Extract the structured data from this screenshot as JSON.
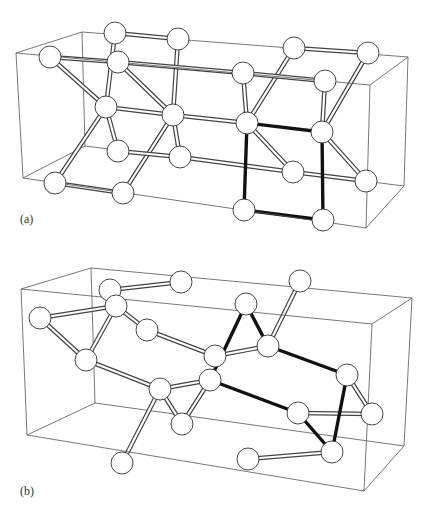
{
  "figure": {
    "width": 433,
    "height": 514,
    "atom_radius": 11,
    "colors": {
      "background": "#ffffff",
      "box_edge": "#555555",
      "bond_outline": "#444444",
      "bond_fill": "#ffffff",
      "highlighted_bond": "#111111",
      "atom_outline": "#333333",
      "atom_shade": "#888888"
    },
    "panels": [
      {
        "id": "a",
        "label": "(a)",
        "label_pos": [
          20,
          212
        ],
        "box": {
          "back": [
            [
              82,
              32
            ],
            [
              408,
              57
            ],
            [
              404,
              186
            ],
            [
              85,
              146
            ]
          ],
          "front": [
            [
              16,
              53
            ],
            [
              370,
              85
            ],
            [
              366,
              228
            ],
            [
              23,
              178
            ]
          ]
        },
        "atoms": [
          {
            "id": "A1",
            "x": 115,
            "y": 33,
            "shaded": true
          },
          {
            "id": "A2",
            "x": 178,
            "y": 39,
            "shaded": false
          },
          {
            "id": "A3",
            "x": 50,
            "y": 57,
            "shaded": true
          },
          {
            "id": "A4",
            "x": 118,
            "y": 62,
            "shaded": false
          },
          {
            "id": "A5",
            "x": 106,
            "y": 107,
            "shaded": false
          },
          {
            "id": "A6",
            "x": 173,
            "y": 115,
            "shaded": true
          },
          {
            "id": "A7",
            "x": 118,
            "y": 151,
            "shaded": true
          },
          {
            "id": "A8",
            "x": 180,
            "y": 157,
            "shaded": false
          },
          {
            "id": "A9",
            "x": 55,
            "y": 183,
            "shaded": true
          },
          {
            "id": "A10",
            "x": 123,
            "y": 193,
            "shaded": false
          },
          {
            "id": "B1",
            "x": 294,
            "y": 48,
            "shaded": false
          },
          {
            "id": "B2",
            "x": 368,
            "y": 53,
            "shaded": true
          },
          {
            "id": "B3",
            "x": 243,
            "y": 73,
            "shaded": false
          },
          {
            "id": "B4",
            "x": 325,
            "y": 81,
            "shaded": true
          },
          {
            "id": "B5",
            "x": 247,
            "y": 123,
            "shaded": true
          },
          {
            "id": "B6",
            "x": 322,
            "y": 132,
            "shaded": false
          },
          {
            "id": "B7",
            "x": 293,
            "y": 172,
            "shaded": false
          },
          {
            "id": "B8",
            "x": 366,
            "y": 181,
            "shaded": true
          },
          {
            "id": "B9",
            "x": 244,
            "y": 210,
            "shaded": false
          },
          {
            "id": "B10",
            "x": 323,
            "y": 220,
            "shaded": true
          }
        ],
        "bonds": [
          [
            "A1",
            "A2",
            false
          ],
          [
            "A1",
            "A5",
            false
          ],
          [
            "A3",
            "A4",
            false
          ],
          [
            "A3",
            "A5",
            false
          ],
          [
            "A4",
            "A6",
            false
          ],
          [
            "A2",
            "A6",
            false
          ],
          [
            "A5",
            "A6",
            false
          ],
          [
            "A5",
            "A7",
            false
          ],
          [
            "A5",
            "A9",
            false
          ],
          [
            "A6",
            "A10",
            false
          ],
          [
            "A6",
            "A8",
            false
          ],
          [
            "A7",
            "A8",
            false
          ],
          [
            "A9",
            "A10",
            false
          ],
          [
            "A6",
            "B5",
            false
          ],
          [
            "A8",
            "B7",
            false
          ],
          [
            "A4",
            "B3",
            false
          ],
          [
            "B1",
            "B2",
            false
          ],
          [
            "B1",
            "B5",
            false
          ],
          [
            "B3",
            "B4",
            false
          ],
          [
            "B3",
            "B5",
            false
          ],
          [
            "B2",
            "B6",
            false
          ],
          [
            "B4",
            "B6",
            false
          ],
          [
            "B5",
            "B7",
            false
          ],
          [
            "B6",
            "B8",
            false
          ],
          [
            "B7",
            "B8",
            false
          ],
          [
            "B5",
            "B6",
            true
          ],
          [
            "B5",
            "B9",
            true
          ],
          [
            "B6",
            "B10",
            true
          ],
          [
            "B9",
            "B10",
            true
          ]
        ]
      },
      {
        "id": "b",
        "label": "(b)",
        "label_pos": [
          20,
          484
        ],
        "box": {
          "back": [
            [
              91,
              268
            ],
            [
              412,
              298
            ],
            [
              404,
              446
            ],
            [
              95,
              403
            ]
          ],
          "front": [
            [
              21,
              289
            ],
            [
              372,
              324
            ],
            [
              364,
              491
            ],
            [
              27,
              435
            ]
          ]
        },
        "atoms": [
          {
            "id": "C1",
            "x": 110,
            "y": 290,
            "shaded": true
          },
          {
            "id": "C2",
            "x": 181,
            "y": 282,
            "shaded": false
          },
          {
            "id": "C3",
            "x": 40,
            "y": 318,
            "shaded": true
          },
          {
            "id": "C4",
            "x": 116,
            "y": 306,
            "shaded": false
          },
          {
            "id": "C5",
            "x": 147,
            "y": 330,
            "shaded": false
          },
          {
            "id": "C6",
            "x": 86,
            "y": 360,
            "shaded": false
          },
          {
            "id": "C7",
            "x": 160,
            "y": 389,
            "shaded": true
          },
          {
            "id": "C8",
            "x": 182,
            "y": 424,
            "shaded": false
          },
          {
            "id": "C9",
            "x": 122,
            "y": 463,
            "shaded": false
          },
          {
            "id": "D1",
            "x": 300,
            "y": 281,
            "shaded": false
          },
          {
            "id": "D2",
            "x": 246,
            "y": 304,
            "shaded": false
          },
          {
            "id": "D3",
            "x": 215,
            "y": 356,
            "shaded": true
          },
          {
            "id": "D4",
            "x": 268,
            "y": 346,
            "shaded": true
          },
          {
            "id": "D5",
            "x": 210,
            "y": 380,
            "shaded": true
          },
          {
            "id": "D6",
            "x": 347,
            "y": 375,
            "shaded": false
          },
          {
            "id": "D7",
            "x": 298,
            "y": 413,
            "shaded": false
          },
          {
            "id": "D8",
            "x": 372,
            "y": 414,
            "shaded": true
          },
          {
            "id": "D9",
            "x": 332,
            "y": 452,
            "shaded": true
          },
          {
            "id": "D10",
            "x": 248,
            "y": 459,
            "shaded": false
          }
        ],
        "bonds": [
          [
            "C1",
            "C2",
            false
          ],
          [
            "C3",
            "C4",
            false
          ],
          [
            "C4",
            "C5",
            false
          ],
          [
            "C3",
            "C6",
            false
          ],
          [
            "C4",
            "C6",
            false
          ],
          [
            "C6",
            "C7",
            false
          ],
          [
            "C5",
            "D3",
            false
          ],
          [
            "C7",
            "C8",
            false
          ],
          [
            "C7",
            "C9",
            false
          ],
          [
            "C7",
            "D5",
            false
          ],
          [
            "C8",
            "D5",
            false
          ],
          [
            "D1",
            "D4",
            false
          ],
          [
            "D3",
            "D4",
            false
          ],
          [
            "D6",
            "D8",
            false
          ],
          [
            "D7",
            "D8",
            false
          ],
          [
            "D9",
            "D10",
            false
          ],
          [
            "D2",
            "D5",
            true
          ],
          [
            "D2",
            "D4",
            true
          ],
          [
            "D4",
            "D6",
            true
          ],
          [
            "D5",
            "D7",
            true
          ],
          [
            "D6",
            "D9",
            true
          ],
          [
            "D7",
            "D9",
            true
          ]
        ]
      }
    ]
  }
}
